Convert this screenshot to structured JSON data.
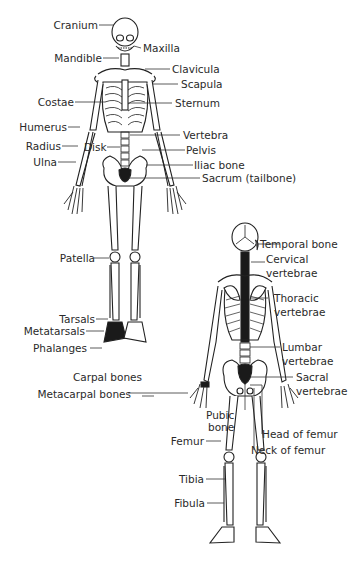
{
  "diagram": {
    "type": "labeled anatomical illustration",
    "views": [
      {
        "name": "anterior view",
        "labels": [
          "Cranium",
          "Maxilla",
          "Mandible",
          "Clavicula",
          "Scapula",
          "Costae",
          "Sternum",
          "Humerus",
          "Vertebra",
          "Radius",
          "Disk",
          "Pelvis",
          "Ulna",
          "Iliac bone",
          "Sacrum (tailbone)",
          "Patella",
          "Tarsals",
          "Metatarsals",
          "Phalanges"
        ]
      },
      {
        "name": "posterior view",
        "labels": [
          "Temporal bone",
          "Cervical vertebrae",
          "Thoracic vertebrae",
          "Lumbar vertebrae",
          "Sacral vertebrae",
          "Carpal bones",
          "Metacarpal bones",
          "Pubic bone",
          "Head of femur",
          "Neck of femur",
          "Femur",
          "Tibia",
          "Fibula"
        ]
      }
    ]
  },
  "labels": {
    "cranium": "Cranium",
    "maxilla": "Maxilla",
    "mandible": "Mandible",
    "clavicula": "Clavicula",
    "scapula": "Scapula",
    "costae": "Costae",
    "sternum": "Sternum",
    "humerus": "Humerus",
    "vertebra": "Vertebra",
    "radius": "Radius",
    "disk": "Disk",
    "pelvis": "Pelvis",
    "ulna": "Ulna",
    "iliac": "Iliac bone",
    "sacrum": "Sacrum (tailbone)",
    "temporal": "Temporal bone",
    "cervical_1": "Cervical",
    "cervical_2": "vertebrae",
    "patella": "Patella",
    "thoracic_1": "Thoracic",
    "thoracic_2": "vertebrae",
    "tarsals": "Tarsals",
    "metatarsals": "Metatarsals",
    "phalanges": "Phalanges",
    "lumbar_1": "Lumbar",
    "lumbar_2": "vertebrae",
    "carpal": "Carpal bones",
    "sacral_1": "Sacral",
    "sacral_2": "vertebrae",
    "metacarpal": "Metacarpal bones",
    "pubic_1": "Pubic",
    "pubic_2": "bone",
    "head_femur": "Head of femur",
    "femur": "Femur",
    "neck_femur": "Neck of femur",
    "tibia": "Tibia",
    "fibula": "Fibula"
  },
  "colors": {
    "ink": "#222222",
    "bone_fill": "#ffffff",
    "dark_fill": "#1a1a1a"
  }
}
